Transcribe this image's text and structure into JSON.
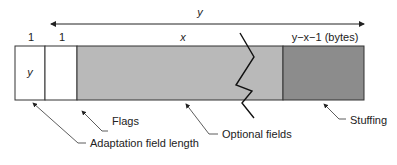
{
  "diagram": {
    "span_label": "y",
    "fields": [
      {
        "id": "adaptation-field-length",
        "size_label": "1",
        "content_label": "y",
        "fill": "#ffffff"
      },
      {
        "id": "flags",
        "size_label": "1",
        "content_label": "",
        "fill": "#ffffff"
      },
      {
        "id": "optional-fields",
        "size_label": "x",
        "content_label": "",
        "fill": "#b9b9b9"
      },
      {
        "id": "stuffing",
        "size_label": "y−x−1 (bytes)",
        "content_label": "",
        "fill": "#8c8c8c"
      }
    ],
    "callouts": {
      "adaptation_field_length": "Adaptation field length",
      "flags": "Flags",
      "optional_fields": "Optional fields",
      "stuffing": "Stuffing"
    }
  }
}
